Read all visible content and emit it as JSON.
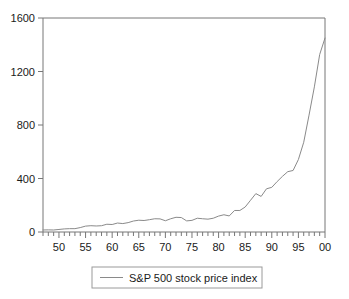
{
  "chart_data": {
    "type": "line",
    "title": "",
    "subtitle": "",
    "xlabel": "",
    "ylabel": "",
    "xlim": [
      1947,
      2000
    ],
    "ylim": [
      0,
      1600
    ],
    "grid": false,
    "legend_position": "bottom-center",
    "y_ticks": [
      0,
      400,
      800,
      1200,
      1600
    ],
    "y_tick_labels": [
      "0",
      "400",
      "800",
      "1200",
      "1600"
    ],
    "x_ticks": [
      1950,
      1955,
      1960,
      1965,
      1970,
      1975,
      1980,
      1985,
      1990,
      1995,
      2000
    ],
    "x_tick_labels": [
      "50",
      "55",
      "60",
      "65",
      "70",
      "75",
      "80",
      "85",
      "90",
      "95",
      "00"
    ],
    "x_minor_tick_interval": 1,
    "series": [
      {
        "name": "S&P 500 stock price index",
        "color": "#8a8a8a",
        "x": [
          1947,
          1948,
          1949,
          1950,
          1951,
          1952,
          1953,
          1954,
          1955,
          1956,
          1957,
          1958,
          1959,
          1960,
          1961,
          1962,
          1963,
          1964,
          1965,
          1966,
          1967,
          1968,
          1969,
          1970,
          1971,
          1972,
          1973,
          1974,
          1975,
          1976,
          1977,
          1978,
          1979,
          1980,
          1981,
          1982,
          1983,
          1984,
          1985,
          1986,
          1987,
          1988,
          1989,
          1990,
          1991,
          1992,
          1993,
          1994,
          1995,
          1996,
          1997,
          1998,
          1999,
          2000
        ],
        "values": [
          15,
          16,
          15,
          19,
          23,
          25,
          25,
          33,
          44,
          47,
          45,
          47,
          58,
          56,
          67,
          63,
          70,
          82,
          88,
          86,
          92,
          99,
          98,
          84,
          99,
          110,
          108,
          83,
          87,
          103,
          99,
          96,
          103,
          119,
          129,
          120,
          161,
          161,
          187,
          237,
          287,
          266,
          323,
          334,
          377,
          416,
          451,
          460,
          542,
          671,
          874,
          1085,
          1327,
          1450
        ],
        "units": "index"
      }
    ]
  },
  "legend": {
    "entries": [
      {
        "label": "S&P 500 stock price index"
      }
    ]
  }
}
